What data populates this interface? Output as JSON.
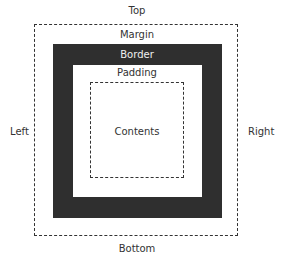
{
  "diagram": {
    "labels": {
      "top": "Top",
      "bottom": "Bottom",
      "left": "Left",
      "right": "Right",
      "margin": "Margin",
      "border": "Border",
      "padding": "Padding",
      "contents": "Contents"
    },
    "colors": {
      "border_fill": "#2f2f2f",
      "line": "#333333",
      "background": "#ffffff"
    }
  }
}
